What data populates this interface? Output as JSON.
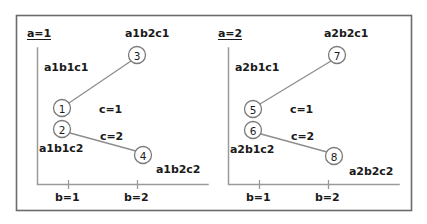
{
  "figure": {
    "type": "two-panel-node-diagram",
    "background_color": "#ffffff",
    "frame_color": "#6b6b6b",
    "axis_color": "#9a9a9a",
    "edge_color": "#8d8d8d",
    "text_color": "#1a1a1a"
  },
  "panels": [
    {
      "title": "a=1",
      "x_ticks": [
        {
          "label": "b=1"
        },
        {
          "label": "b=2"
        }
      ],
      "nodes": [
        {
          "id": "1",
          "label": "a1b1c1"
        },
        {
          "id": "3",
          "label": "a1b2c1"
        },
        {
          "id": "2",
          "label": "a1b1c2"
        },
        {
          "id": "4",
          "label": "a1b2c2"
        }
      ],
      "edges": [
        {
          "from": "1",
          "to": "3",
          "label": "c=1"
        },
        {
          "from": "2",
          "to": "4",
          "label": "c=2"
        }
      ]
    },
    {
      "title": "a=2",
      "x_ticks": [
        {
          "label": "b=1"
        },
        {
          "label": "b=2"
        }
      ],
      "nodes": [
        {
          "id": "5",
          "label": "a2b1c1"
        },
        {
          "id": "7",
          "label": "a2b2c1"
        },
        {
          "id": "6",
          "label": "a2b1c2"
        },
        {
          "id": "8",
          "label": "a2b2c2"
        }
      ],
      "edges": [
        {
          "from": "5",
          "to": "7",
          "label": "c=1"
        },
        {
          "from": "6",
          "to": "8",
          "label": "c=2"
        }
      ]
    }
  ]
}
